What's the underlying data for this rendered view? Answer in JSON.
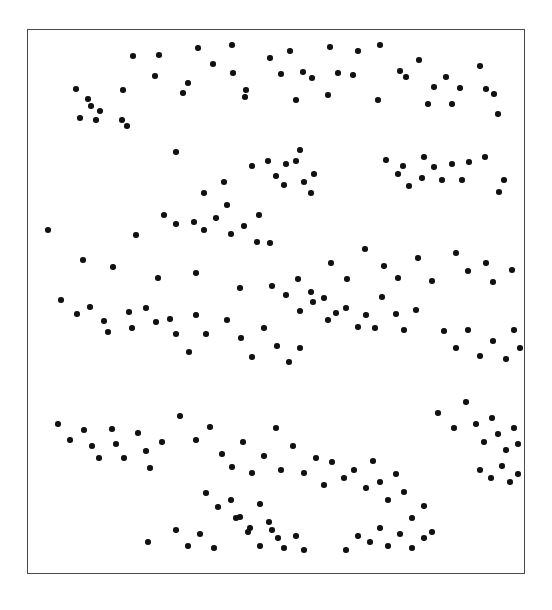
{
  "figure": {
    "title": "",
    "background_color": "#ffffff",
    "frame": {
      "name": "plot-border",
      "x": 27,
      "y": 29,
      "width": 498,
      "height": 545,
      "stroke_color": "#4a4a4a",
      "stroke_width": 1.4,
      "fill_color": "#ffffff"
    },
    "marker": {
      "shape": "circle",
      "color": "#111111",
      "diameter_px": 5.6
    }
  },
  "chart_data": {
    "type": "scatter",
    "title": "",
    "xlabel": "",
    "ylabel": "",
    "xlim": [
      0,
      1
    ],
    "ylim": [
      0,
      1
    ],
    "grid": false,
    "legend": null,
    "axis_ticks": {
      "x": [],
      "y": []
    },
    "n_points": 204,
    "point_units": "pixels, origin at top-left of plot frame interior",
    "points": [
      [
        105,
        26
      ],
      [
        131,
        25
      ],
      [
        170,
        18
      ],
      [
        185,
        34
      ],
      [
        204,
        15
      ],
      [
        205,
        43
      ],
      [
        127,
        46
      ],
      [
        160,
        53
      ],
      [
        155,
        63
      ],
      [
        218,
        60
      ],
      [
        217,
        67
      ],
      [
        48,
        59
      ],
      [
        60,
        69
      ],
      [
        63,
        76
      ],
      [
        52,
        88
      ],
      [
        72,
        81
      ],
      [
        95,
        60
      ],
      [
        68,
        90
      ],
      [
        94,
        90
      ],
      [
        99,
        96
      ],
      [
        242,
        28
      ],
      [
        262,
        21
      ],
      [
        275,
        42
      ],
      [
        302,
        17
      ],
      [
        310,
        43
      ],
      [
        284,
        48
      ],
      [
        253,
        44
      ],
      [
        268,
        70
      ],
      [
        300,
        65
      ],
      [
        330,
        21
      ],
      [
        352,
        15
      ],
      [
        325,
        45
      ],
      [
        372,
        41
      ],
      [
        378,
        47
      ],
      [
        350,
        70
      ],
      [
        391,
        30
      ],
      [
        406,
        57
      ],
      [
        400,
        74
      ],
      [
        418,
        47
      ],
      [
        424,
        74
      ],
      [
        432,
        58
      ],
      [
        452,
        36
      ],
      [
        458,
        59
      ],
      [
        466,
        64
      ],
      [
        470,
        84
      ],
      [
        240,
        131
      ],
      [
        248,
        146
      ],
      [
        258,
        134
      ],
      [
        268,
        131
      ],
      [
        272,
        120
      ],
      [
        256,
        155
      ],
      [
        276,
        152
      ],
      [
        286,
        144
      ],
      [
        283,
        163
      ],
      [
        148,
        122
      ],
      [
        176,
        163
      ],
      [
        196,
        152
      ],
      [
        199,
        175
      ],
      [
        224,
        136
      ],
      [
        136,
        185
      ],
      [
        148,
        194
      ],
      [
        166,
        192
      ],
      [
        176,
        200
      ],
      [
        188,
        188
      ],
      [
        203,
        204
      ],
      [
        216,
        196
      ],
      [
        231,
        185
      ],
      [
        229,
        212
      ],
      [
        242,
        213
      ],
      [
        358,
        130
      ],
      [
        370,
        144
      ],
      [
        375,
        136
      ],
      [
        396,
        127
      ],
      [
        394,
        148
      ],
      [
        381,
        156
      ],
      [
        406,
        137
      ],
      [
        414,
        150
      ],
      [
        424,
        134
      ],
      [
        434,
        150
      ],
      [
        441,
        132
      ],
      [
        457,
        127
      ],
      [
        476,
        150
      ],
      [
        471,
        162
      ],
      [
        20,
        200
      ],
      [
        55,
        230
      ],
      [
        85,
        237
      ],
      [
        108,
        205
      ],
      [
        130,
        248
      ],
      [
        168,
        243
      ],
      [
        212,
        258
      ],
      [
        244,
        256
      ],
      [
        270,
        249
      ],
      [
        283,
        262
      ],
      [
        303,
        233
      ],
      [
        319,
        249
      ],
      [
        337,
        219
      ],
      [
        356,
        236
      ],
      [
        370,
        248
      ],
      [
        390,
        228
      ],
      [
        404,
        251
      ],
      [
        428,
        223
      ],
      [
        440,
        241
      ],
      [
        458,
        233
      ],
      [
        465,
        252
      ],
      [
        484,
        240
      ],
      [
        33,
        270
      ],
      [
        49,
        284
      ],
      [
        62,
        277
      ],
      [
        76,
        291
      ],
      [
        80,
        302
      ],
      [
        101,
        282
      ],
      [
        104,
        298
      ],
      [
        118,
        278
      ],
      [
        128,
        292
      ],
      [
        142,
        289
      ],
      [
        148,
        304
      ],
      [
        161,
        322
      ],
      [
        168,
        285
      ],
      [
        178,
        304
      ],
      [
        258,
        265
      ],
      [
        272,
        281
      ],
      [
        285,
        272
      ],
      [
        296,
        268
      ],
      [
        300,
        290
      ],
      [
        308,
        283
      ],
      [
        318,
        278
      ],
      [
        330,
        297
      ],
      [
        338,
        285
      ],
      [
        347,
        298
      ],
      [
        354,
        267
      ],
      [
        368,
        284
      ],
      [
        376,
        300
      ],
      [
        388,
        280
      ],
      [
        199,
        290
      ],
      [
        213,
        308
      ],
      [
        224,
        327
      ],
      [
        236,
        298
      ],
      [
        249,
        316
      ],
      [
        261,
        332
      ],
      [
        272,
        318
      ],
      [
        416,
        301
      ],
      [
        428,
        318
      ],
      [
        440,
        300
      ],
      [
        452,
        326
      ],
      [
        465,
        311
      ],
      [
        478,
        329
      ],
      [
        486,
        300
      ],
      [
        492,
        318
      ],
      [
        30,
        394
      ],
      [
        42,
        410
      ],
      [
        56,
        400
      ],
      [
        64,
        416
      ],
      [
        71,
        428
      ],
      [
        84,
        399
      ],
      [
        88,
        414
      ],
      [
        96,
        428
      ],
      [
        110,
        403
      ],
      [
        118,
        421
      ],
      [
        122,
        438
      ],
      [
        134,
        412
      ],
      [
        152,
        386
      ],
      [
        168,
        410
      ],
      [
        182,
        397
      ],
      [
        194,
        424
      ],
      [
        204,
        437
      ],
      [
        215,
        412
      ],
      [
        224,
        443
      ],
      [
        236,
        426
      ],
      [
        248,
        398
      ],
      [
        253,
        440
      ],
      [
        265,
        416
      ],
      [
        276,
        443
      ],
      [
        288,
        428
      ],
      [
        296,
        455
      ],
      [
        178,
        463
      ],
      [
        190,
        477
      ],
      [
        203,
        470
      ],
      [
        212,
        487
      ],
      [
        222,
        498
      ],
      [
        232,
        474
      ],
      [
        241,
        492
      ],
      [
        250,
        508
      ],
      [
        304,
        432
      ],
      [
        316,
        448
      ],
      [
        326,
        440
      ],
      [
        338,
        458
      ],
      [
        345,
        431
      ],
      [
        352,
        452
      ],
      [
        360,
        470
      ],
      [
        368,
        444
      ],
      [
        376,
        462
      ],
      [
        384,
        488
      ],
      [
        396,
        476
      ],
      [
        404,
        502
      ],
      [
        410,
        383
      ],
      [
        426,
        398
      ],
      [
        438,
        372
      ],
      [
        448,
        394
      ],
      [
        456,
        412
      ],
      [
        464,
        388
      ],
      [
        470,
        404
      ],
      [
        478,
        420
      ],
      [
        486,
        398
      ],
      [
        490,
        414
      ],
      [
        452,
        440
      ],
      [
        463,
        448
      ],
      [
        474,
        436
      ],
      [
        482,
        452
      ],
      [
        490,
        444
      ],
      [
        318,
        520
      ],
      [
        330,
        506
      ],
      [
        342,
        512
      ],
      [
        352,
        498
      ],
      [
        360,
        516
      ],
      [
        372,
        504
      ],
      [
        384,
        518
      ],
      [
        396,
        508
      ],
      [
        208,
        488
      ],
      [
        220,
        502
      ],
      [
        232,
        516
      ],
      [
        244,
        500
      ],
      [
        256,
        518
      ],
      [
        268,
        506
      ],
      [
        276,
        520
      ],
      [
        148,
        500
      ],
      [
        160,
        516
      ],
      [
        172,
        504
      ],
      [
        186,
        518
      ],
      [
        120,
        512
      ]
    ]
  }
}
